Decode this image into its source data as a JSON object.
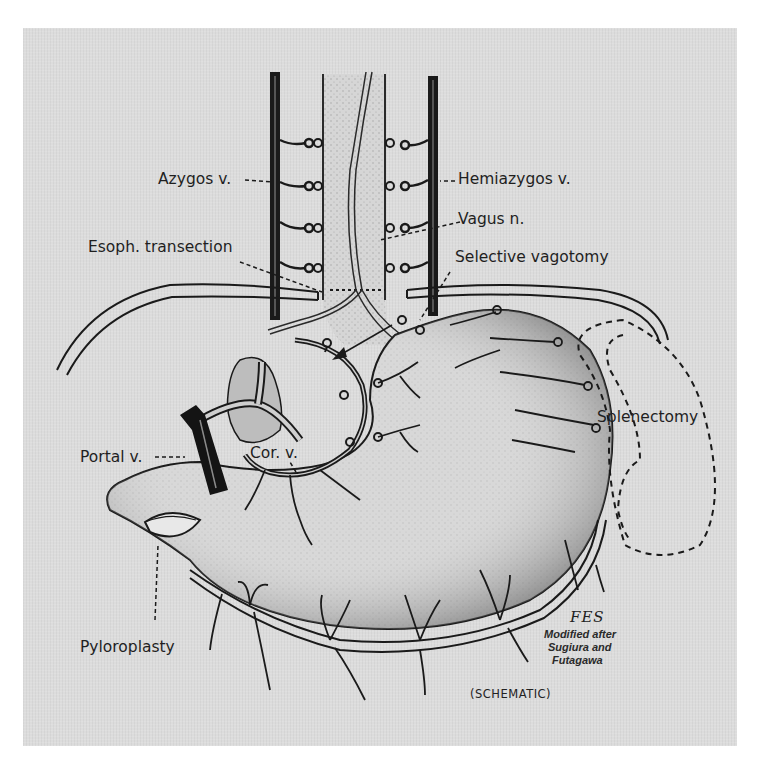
{
  "figure": {
    "labels": {
      "azygos": "Azygos v.",
      "hemiazygos": "Hemiazygos v.",
      "vagus": "Vagus n.",
      "esoph_transection": "Esoph. transection",
      "selective_vagotomy": "Selective vagotomy",
      "splenectomy": "Splenectomy",
      "portal": "Portal v.",
      "coronary": "Cor. v.",
      "pyloroplasty": "Pyloroplasty"
    },
    "signature": "FES",
    "credit": {
      "line1": "Modified after",
      "line2": "Sugiura and",
      "line3": "Futagawa"
    },
    "caption": "(SCHEMATIC)"
  }
}
